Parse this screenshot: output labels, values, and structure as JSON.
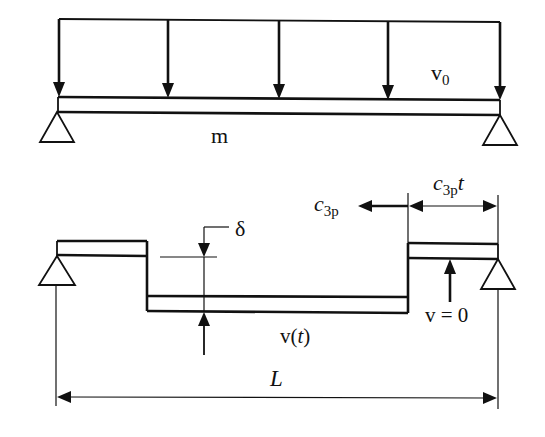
{
  "figure": {
    "type": "structural-mechanics-diagram",
    "colors": {
      "ink": "#111111",
      "background": "#ffffff"
    }
  },
  "top_panel": {
    "mass_label": "m",
    "velocity_label": {
      "base": "v",
      "subscript": "0"
    },
    "load_arrow_count": 5,
    "supports": [
      "pin-support-left",
      "pin-support-right"
    ]
  },
  "bottom_panel": {
    "wave_speed_label": {
      "base": "c",
      "subscript": "3p"
    },
    "travel_distance_label": {
      "base": "c",
      "subscript": "3p",
      "suffix": "t"
    },
    "deflection_label": "δ",
    "moving_velocity_label": {
      "base": "v(",
      "italic": "t",
      "close": ")"
    },
    "rest_velocity_label": "v = 0",
    "span_label": "L",
    "supports": [
      "pin-support-left",
      "pin-support-right"
    ]
  }
}
